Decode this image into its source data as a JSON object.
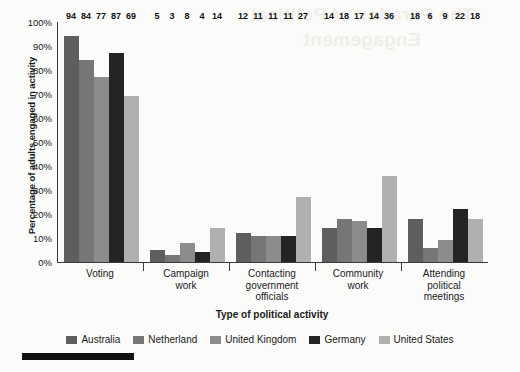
{
  "artifacts": {
    "showthrough_text": "The Paradox of Political Engagement",
    "page_marker_name": "page-edge-marker"
  },
  "chart_data": {
    "type": "bar",
    "title": "",
    "xlabel": "Type of political activity",
    "ylabel": "Percentage of adults engaged in activity",
    "ylim": [
      0,
      100
    ],
    "yticks": [
      "0%",
      "10%",
      "20%",
      "30%",
      "40%",
      "50%",
      "60%",
      "70%",
      "80%",
      "90%",
      "100%"
    ],
    "ytick_values": [
      0,
      10,
      20,
      30,
      40,
      50,
      60,
      70,
      80,
      90,
      100
    ],
    "grid": false,
    "legend_position": "bottom",
    "categories": [
      "Voting",
      "Campaign work",
      "Contacting government officials",
      "Community work",
      "Attending political meetings"
    ],
    "category_lines": [
      [
        "Voting"
      ],
      [
        "Campaign",
        "work"
      ],
      [
        "Contacting",
        "government",
        "officials"
      ],
      [
        "Community",
        "work"
      ],
      [
        "Attending",
        "political",
        "meetings"
      ]
    ],
    "series": [
      {
        "name": "Australia",
        "color": "#5e5e5e",
        "values": [
          94,
          5,
          12,
          14,
          18
        ]
      },
      {
        "name": "Netherland",
        "color": "#767676",
        "values": [
          84,
          3,
          11,
          18,
          6
        ]
      },
      {
        "name": "United Kingdom",
        "color": "#8c8c8c",
        "values": [
          77,
          8,
          11,
          17,
          9
        ]
      },
      {
        "name": "Germany",
        "color": "#242424",
        "values": [
          87,
          4,
          11,
          14,
          22
        ]
      },
      {
        "name": "United States",
        "color": "#b0b0b0",
        "values": [
          69,
          14,
          27,
          36,
          18
        ]
      }
    ]
  }
}
